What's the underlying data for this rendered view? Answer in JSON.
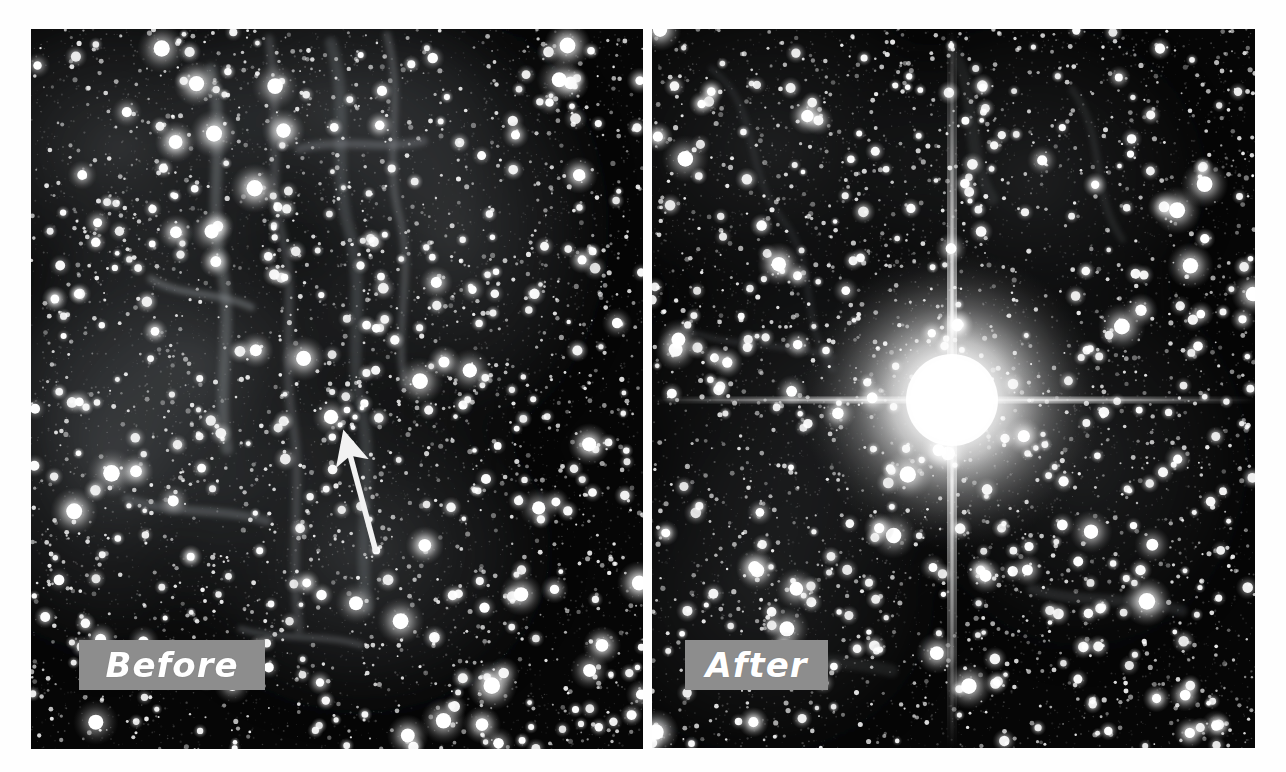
{
  "figure": {
    "background_color": "#ffffff"
  },
  "panels": [
    {
      "id": "before",
      "label": "Before",
      "label_text_color": "#ffffff",
      "label_box_color": "#8d8d8d",
      "description": "Dense star field in the Large Magellanic Cloud with faint nebular filaments; a white arrow points up-left to the supernova progenitor star.",
      "bounds": {
        "x": 31,
        "y": 29,
        "width": 612,
        "height": 720
      },
      "label_box": {
        "x": 48,
        "y": 611,
        "width": 186,
        "height": 50
      },
      "annotation": {
        "type": "arrow",
        "name": "progenitor-arrow",
        "color": "#f2f2f2",
        "tail": {
          "x": 345,
          "y": 523
        },
        "tip": {
          "x": 311,
          "y": 401
        },
        "target_label": "progenitor star"
      }
    },
    {
      "id": "after",
      "label": "After",
      "label_text_color": "#ffffff",
      "label_box_color": "#8d8d8d",
      "description": "Same star field after the supernova explosion; an extremely bright saturated star with vertical and horizontal diffraction spikes dominates the centre.",
      "bounds": {
        "x": 652,
        "y": 29,
        "width": 603,
        "height": 719
      },
      "label_box": {
        "x": 685,
        "y": 611,
        "width": 143,
        "height": 50
      },
      "supernova": {
        "name": "supernova-source",
        "center": {
          "x": 300,
          "y": 371
        },
        "core_radius": 46,
        "halo_radius": 150,
        "spike_color": "#ffffff"
      }
    }
  ],
  "colors": {
    "sky": "#050505",
    "star": "#ffffff",
    "nebula": "#6f6f6f",
    "label_gray": "#8d8d8d",
    "page": "#ffffff"
  }
}
